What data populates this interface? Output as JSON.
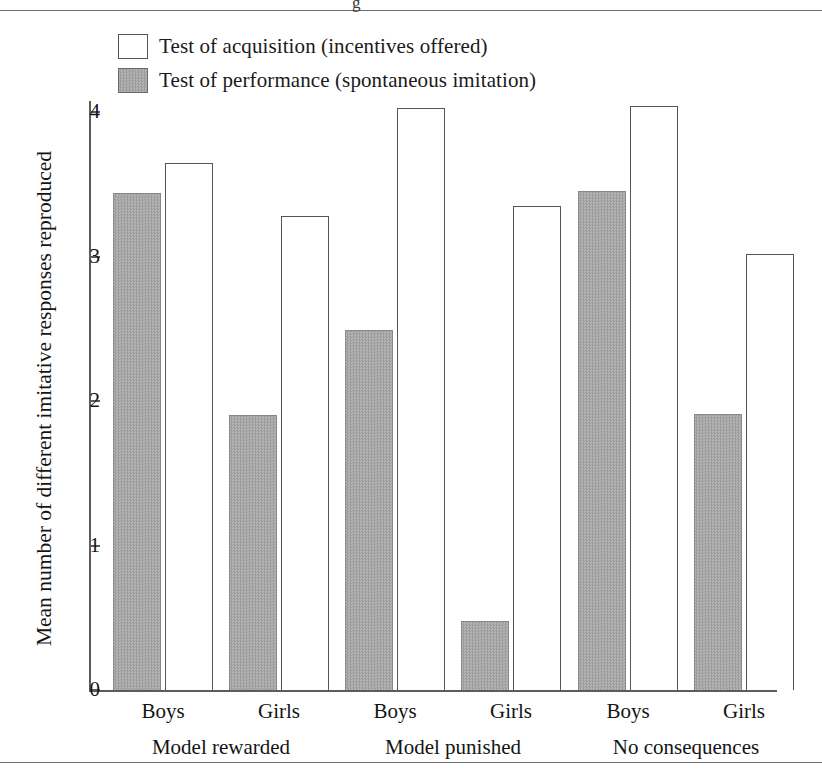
{
  "figure": {
    "legend": [
      {
        "key": "acquisition",
        "style": "open",
        "label": "Test of acquisition (incentives offered)"
      },
      {
        "key": "performance",
        "style": "filled",
        "label": "Test of performance (spontaneous imitation)"
      }
    ],
    "y_axis_title": "Mean number of different imitative responses reproduced",
    "y_tick_labels": [
      "4",
      "3",
      "2",
      "1",
      "0"
    ],
    "category_labels": [
      "Boys",
      "Girls",
      "Boys",
      "Girls",
      "Boys",
      "Girls"
    ],
    "group_labels": [
      "Model rewarded",
      "Model punished",
      "No consequences"
    ],
    "colors": {
      "bar_fill_gray": "#aaaaaa",
      "bar_outline": "#555555",
      "axis": "#5c5c5c",
      "text": "#141414",
      "background": "#ffffff"
    }
  },
  "chart_data": {
    "type": "bar",
    "title": "",
    "xlabel": "",
    "ylabel": "Mean number of different imitative responses reproduced",
    "ylim": [
      0,
      4.3
    ],
    "yticks": [
      0,
      1,
      2,
      3,
      4
    ],
    "grid": false,
    "legend_position": "top-left",
    "categories": [
      "Model rewarded / Boys",
      "Model rewarded / Girls",
      "Model punished / Boys",
      "Model punished / Girls",
      "No consequences / Boys",
      "No consequences / Girls"
    ],
    "groups": [
      {
        "name": "Model rewarded",
        "subcategories": [
          "Boys",
          "Girls"
        ]
      },
      {
        "name": "Model punished",
        "subcategories": [
          "Boys",
          "Girls"
        ]
      },
      {
        "name": "No consequences",
        "subcategories": [
          "Boys",
          "Girls"
        ]
      }
    ],
    "series": [
      {
        "name": "Test of performance (spontaneous imitation)",
        "style": "filled",
        "values": [
          3.44,
          1.9,
          2.49,
          0.48,
          3.45,
          1.91
        ]
      },
      {
        "name": "Test of acquisition (incentives offered)",
        "style": "open",
        "values": [
          3.65,
          3.28,
          4.03,
          3.35,
          4.04,
          3.02
        ]
      }
    ],
    "bars": [
      {
        "group": "Model rewarded",
        "sex": "Boys",
        "series": "Test of performance (spontaneous imitation)",
        "value": 3.44
      },
      {
        "group": "Model rewarded",
        "sex": "Boys",
        "series": "Test of acquisition (incentives offered)",
        "value": 3.65
      },
      {
        "group": "Model rewarded",
        "sex": "Girls",
        "series": "Test of performance (spontaneous imitation)",
        "value": 1.9
      },
      {
        "group": "Model rewarded",
        "sex": "Girls",
        "series": "Test of acquisition (incentives offered)",
        "value": 3.28
      },
      {
        "group": "Model punished",
        "sex": "Boys",
        "series": "Test of performance (spontaneous imitation)",
        "value": 2.49
      },
      {
        "group": "Model punished",
        "sex": "Boys",
        "series": "Test of acquisition (incentives offered)",
        "value": 4.03
      },
      {
        "group": "Model punished",
        "sex": "Girls",
        "series": "Test of performance (spontaneous imitation)",
        "value": 0.48
      },
      {
        "group": "Model punished",
        "sex": "Girls",
        "series": "Test of acquisition (incentives offered)",
        "value": 3.35
      },
      {
        "group": "No consequences",
        "sex": "Boys",
        "series": "Test of performance (spontaneous imitation)",
        "value": 3.45
      },
      {
        "group": "No consequences",
        "sex": "Boys",
        "series": "Test of acquisition (incentives offered)",
        "value": 4.04
      },
      {
        "group": "No consequences",
        "sex": "Girls",
        "series": "Test of performance (spontaneous imitation)",
        "value": 1.91
      },
      {
        "group": "No consequences",
        "sex": "Girls",
        "series": "Test of acquisition (incentives offered)",
        "value": 3.02
      }
    ]
  },
  "scan": {
    "top_artifact_glyph": "g"
  }
}
